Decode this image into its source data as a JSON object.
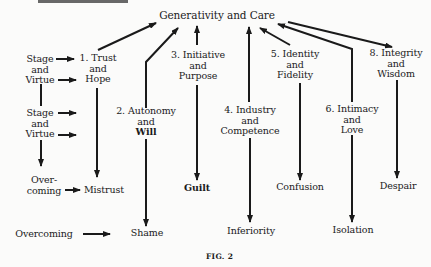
{
  "figure": {
    "caption": "FIG. 2",
    "center": "Generativity and Care"
  },
  "stages": [
    {
      "num": "1.",
      "line1": "1. Trust",
      "line2": "and",
      "line3": "Hope",
      "negative": "Mistrust"
    },
    {
      "num": "2.",
      "line1": "2. Autonomy",
      "line2": "and",
      "line3": "Will",
      "negative": "Shame"
    },
    {
      "num": "3.",
      "line1": "3. Initiative",
      "line2": "and",
      "line3": "Purpose",
      "negative": "Guilt"
    },
    {
      "num": "4.",
      "line1": "4. Industry",
      "line2": "and",
      "line3": "Competence",
      "negative": "Inferiority"
    },
    {
      "num": "5.",
      "line1": "5. Identity",
      "line2": "and",
      "line3": "Fidelity",
      "negative": "Confusion"
    },
    {
      "num": "6.",
      "line1": "6. Intimacy",
      "line2": "and",
      "line3": "Love",
      "negative": "Isolation"
    },
    {
      "num": "8.",
      "line1": "8. Integrity",
      "line2": "and",
      "line3": "Wisdom",
      "negative": "Despair"
    }
  ],
  "legend": {
    "stage_virtue_1": {
      "line1": "Stage",
      "line2": "and",
      "line3": "Virtue"
    },
    "stage_virtue_2": {
      "line1": "Stage",
      "line2": "and",
      "line3": "Virtue"
    },
    "overcoming_short": {
      "line1": "Over-",
      "line2": "coming"
    },
    "overcoming_long": "Overcoming"
  },
  "colors": {
    "ink": "#1a1a1a",
    "paper": "#fbfbfa"
  }
}
